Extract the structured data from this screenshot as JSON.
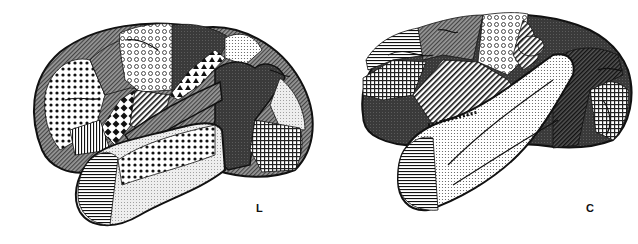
{
  "figure": {
    "panels": [
      {
        "id": "left",
        "label": "L",
        "description": "Lateral view of cortical hemisphere with patterned regions"
      },
      {
        "id": "right",
        "label": "C",
        "description": "Lateral view of cortical hemisphere with patterned regions"
      }
    ],
    "colors": {
      "outline": "#111111",
      "dark_fill": "#3a3a3a",
      "mid_fill": "#777777",
      "light_fill": "#d8d8d8",
      "background": "#ffffff"
    }
  }
}
